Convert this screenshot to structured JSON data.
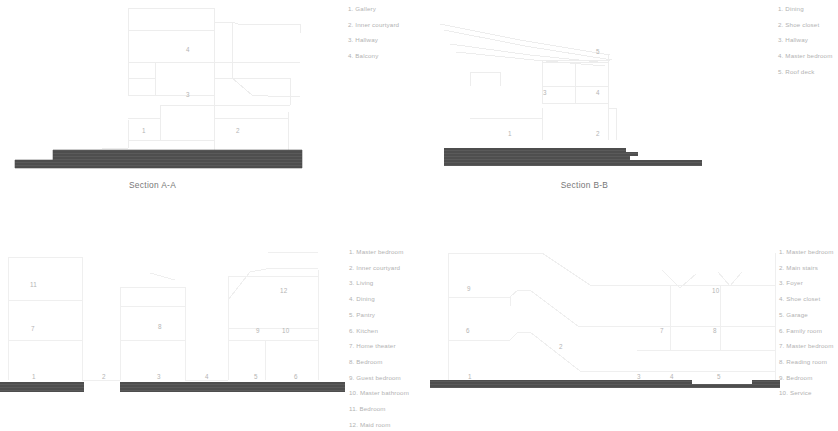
{
  "sheet": {
    "title": "Architectural sections sheet",
    "line_color": "#ededed",
    "ground_color": "#4e4e4e",
    "text_color": "#b2b2b2"
  },
  "sections": {
    "a": {
      "caption": "Section A-A",
      "legend": [
        "1. Gallery",
        "2. Inner courtyard",
        "3. Hallway",
        "4. Balcony"
      ],
      "room_labels": [
        {
          "n": "4",
          "x": 186,
          "y": 46
        },
        {
          "n": "3",
          "x": 186,
          "y": 91
        },
        {
          "n": "1",
          "x": 142,
          "y": 127
        },
        {
          "n": "2",
          "x": 236,
          "y": 127
        }
      ]
    },
    "b": {
      "caption": "Section B-B",
      "legend": [
        "1. Dining",
        "2. Shoe closet",
        "3. Hallway",
        "4. Master bedroom",
        "5. Roof deck"
      ],
      "room_labels": [
        {
          "n": "5",
          "x": 596,
          "y": 48
        },
        {
          "n": "3",
          "x": 543,
          "y": 89
        },
        {
          "n": "4",
          "x": 596,
          "y": 89
        },
        {
          "n": "1",
          "x": 508,
          "y": 130
        },
        {
          "n": "2",
          "x": 596,
          "y": 130
        }
      ]
    },
    "c": {
      "legend": [
        "1. Master bedroom",
        "2. Inner courtyard",
        "3. Living",
        "4. Dining",
        "5. Pantry",
        "6. Kitchen",
        "7. Home theater",
        "8. Bedroom",
        "9. Guest bedroom",
        "10. Master bathroom",
        "11. Bedroom",
        "12. Maid room"
      ],
      "room_labels": [
        {
          "n": "11",
          "x": 30,
          "y": 281
        },
        {
          "n": "12",
          "x": 280,
          "y": 287
        },
        {
          "n": "7",
          "x": 31,
          "y": 325
        },
        {
          "n": "8",
          "x": 158,
          "y": 323
        },
        {
          "n": "9",
          "x": 256,
          "y": 327
        },
        {
          "n": "10",
          "x": 282,
          "y": 327
        },
        {
          "n": "1",
          "x": 32,
          "y": 373
        },
        {
          "n": "2",
          "x": 102,
          "y": 373
        },
        {
          "n": "3",
          "x": 157,
          "y": 373
        },
        {
          "n": "4",
          "x": 205,
          "y": 373
        },
        {
          "n": "5",
          "x": 254,
          "y": 373
        },
        {
          "n": "6",
          "x": 294,
          "y": 373
        }
      ]
    },
    "d": {
      "legend": [
        "1. Master bedroom",
        "2. Main stairs",
        "3. Foyer",
        "4. Shoe closet",
        "5. Garage",
        "6. Family room",
        "7. Master bedroom",
        "8. Reading room",
        "9. Bedroom",
        "10. Service"
      ],
      "room_labels": [
        {
          "n": "9",
          "x": 467,
          "y": 285
        },
        {
          "n": "10",
          "x": 712,
          "y": 287
        },
        {
          "n": "6",
          "x": 466,
          "y": 327
        },
        {
          "n": "7",
          "x": 660,
          "y": 327
        },
        {
          "n": "8",
          "x": 713,
          "y": 327
        },
        {
          "n": "2",
          "x": 559,
          "y": 343
        },
        {
          "n": "1",
          "x": 468,
          "y": 373
        },
        {
          "n": "3",
          "x": 637,
          "y": 373
        },
        {
          "n": "4",
          "x": 670,
          "y": 373
        },
        {
          "n": "5",
          "x": 717,
          "y": 373
        }
      ]
    }
  }
}
